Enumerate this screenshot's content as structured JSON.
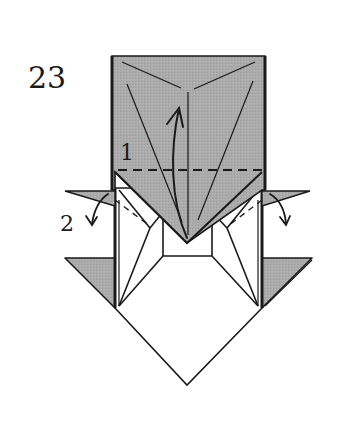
{
  "diagram": {
    "step_number": "23",
    "labels": {
      "step1": "1",
      "step2": "2"
    },
    "colors": {
      "paper_colored": "#a8a8a8",
      "paper_white": "#ffffff",
      "line": "#1a1a1a"
    },
    "annotations": [
      {
        "id": "valley-fold-1",
        "type": "dashed-line",
        "label": "1",
        "description": "valley fold, fold flap up"
      },
      {
        "id": "fold-arrow-up",
        "type": "arrow",
        "label": "1",
        "direction": "up"
      },
      {
        "id": "fold-arrows-side",
        "type": "arrow",
        "label": "2",
        "direction": "outward-down"
      }
    ]
  }
}
